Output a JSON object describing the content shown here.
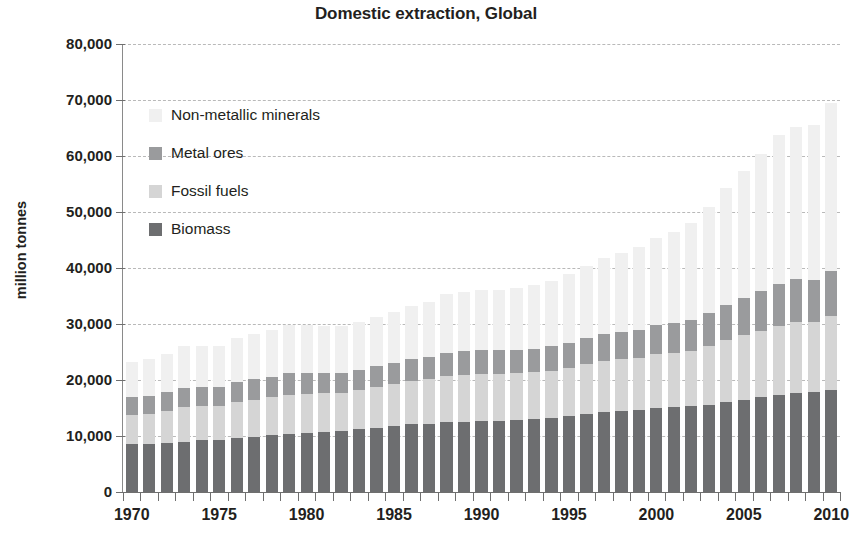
{
  "chart_data": {
    "type": "bar",
    "stacked": true,
    "title": "Domestic extraction, Global",
    "xlabel": "",
    "ylabel": "million tonnes",
    "ylim": [
      0,
      80000
    ],
    "ytick_labels": [
      "80,000",
      "70,000",
      "60,000",
      "50,000",
      "40,000",
      "30,000",
      "20,000",
      "10,000",
      "0"
    ],
    "ytick_values": [
      80000,
      70000,
      60000,
      50000,
      40000,
      30000,
      20000,
      10000,
      0
    ],
    "grid": true,
    "legend_position": "inside-upper-left",
    "x": [
      1970,
      1971,
      1972,
      1973,
      1974,
      1975,
      1976,
      1977,
      1978,
      1979,
      1980,
      1981,
      1982,
      1983,
      1984,
      1985,
      1986,
      1987,
      1988,
      1989,
      1990,
      1991,
      1992,
      1993,
      1994,
      1995,
      1996,
      1997,
      1998,
      1999,
      2000,
      2001,
      2002,
      2003,
      2004,
      2005,
      2006,
      2007,
      2008,
      2009,
      2010
    ],
    "xtick_labels": [
      "1970",
      "1975",
      "1980",
      "1985",
      "1990",
      "1995",
      "2000",
      "2005",
      "2010"
    ],
    "xtick_values": [
      1970,
      1975,
      1980,
      1985,
      1990,
      1995,
      2000,
      2005,
      2010
    ],
    "series": [
      {
        "name": "Biomass",
        "color": "#6d6e70",
        "values": [
          8500,
          8500,
          8700,
          9000,
          9200,
          9300,
          9700,
          9900,
          10200,
          10300,
          10500,
          10700,
          10900,
          11300,
          11500,
          11700,
          12100,
          12200,
          12500,
          12500,
          12700,
          12700,
          12800,
          13000,
          13200,
          13500,
          13900,
          14200,
          14400,
          14700,
          15000,
          15100,
          15300,
          15600,
          16100,
          16500,
          16900,
          17400,
          17700,
          17900,
          18200
        ]
      },
      {
        "name": "Fossil fuels",
        "color": "#d5d5d5",
        "values": [
          5300,
          5500,
          5800,
          6100,
          6100,
          6100,
          6400,
          6600,
          6800,
          7100,
          7000,
          6900,
          6800,
          6900,
          7200,
          7500,
          7700,
          7900,
          8200,
          8400,
          8400,
          8400,
          8400,
          8400,
          8500,
          8700,
          9000,
          9200,
          9300,
          9300,
          9600,
          9800,
          9900,
          10400,
          11000,
          11500,
          11900,
          12300,
          12700,
          12500,
          13200
        ]
      },
      {
        "name": "Metal ores",
        "color": "#9a9b9d",
        "values": [
          3200,
          3200,
          3300,
          3500,
          3500,
          3300,
          3500,
          3600,
          3600,
          3800,
          3800,
          3700,
          3600,
          3600,
          3800,
          3900,
          3900,
          4000,
          4200,
          4300,
          4300,
          4200,
          4200,
          4200,
          4300,
          4500,
          4600,
          4800,
          4800,
          4900,
          5200,
          5300,
          5500,
          5900,
          6300,
          6700,
          7100,
          7500,
          7600,
          7400,
          8100
        ]
      },
      {
        "name": "Non-metallic minerals",
        "color": "#f0f0f0",
        "values": [
          6300,
          6500,
          6900,
          7400,
          7300,
          7400,
          7900,
          8100,
          8400,
          8600,
          8500,
          8300,
          8300,
          8600,
          8800,
          9100,
          9500,
          9900,
          10400,
          10600,
          10700,
          10700,
          11000,
          11300,
          11700,
          12200,
          12900,
          13600,
          14100,
          14800,
          15600,
          16300,
          17400,
          19000,
          20900,
          22600,
          24500,
          26500,
          27200,
          27800,
          30000
        ]
      }
    ]
  },
  "legend": {
    "entries": [
      {
        "label": "Non-metallic minerals",
        "color": "#f0f0f0"
      },
      {
        "label": "Metal ores",
        "color": "#9a9b9d"
      },
      {
        "label": "Fossil fuels",
        "color": "#d5d5d5"
      },
      {
        "label": "Biomass",
        "color": "#6d6e70"
      }
    ]
  }
}
